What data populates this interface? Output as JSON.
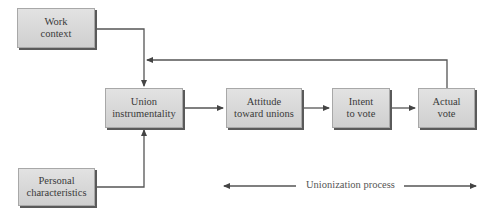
{
  "diagram": {
    "nodes": {
      "work_context": {
        "line1": "Work",
        "line2": "context"
      },
      "personal_characteristics": {
        "line1": "Personal",
        "line2": "characteristics"
      },
      "union_instrumentality": {
        "line1": "Union",
        "line2": "instrumentality"
      },
      "attitude": {
        "line1": "Attitude",
        "line2": "toward unions"
      },
      "intent": {
        "line1": "Intent",
        "line2": "to vote"
      },
      "actual_vote": {
        "line1": "Actual",
        "line2": "vote"
      }
    },
    "edges": [
      {
        "from": "Work context",
        "to": "Union instrumentality"
      },
      {
        "from": "Personal characteristics",
        "to": "Union instrumentality"
      },
      {
        "from": "Union instrumentality",
        "to": "Attitude toward unions"
      },
      {
        "from": "Attitude toward unions",
        "to": "Intent to vote"
      },
      {
        "from": "Intent to vote",
        "to": "Actual vote"
      },
      {
        "from": "Actual vote",
        "to": "Union instrumentality",
        "type": "feedback"
      }
    ],
    "process_label": "Unionization process"
  }
}
